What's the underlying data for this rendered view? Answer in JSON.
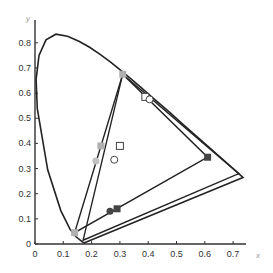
{
  "chart_data": {
    "type": "scatter",
    "title": "",
    "xlabel": "x",
    "ylabel": "y",
    "xlim": [
      0,
      0.78
    ],
    "ylim": [
      0,
      0.85
    ],
    "x_ticks": [
      "0",
      "0.1",
      "0.2",
      "0.3",
      "0.4",
      "0.5",
      "0.6",
      "0.7"
    ],
    "y_ticks": [
      "0",
      "0.1",
      "0.2",
      "0.3",
      "0.4",
      "0.5",
      "0.6",
      "0.7",
      "0.8"
    ],
    "grid": false,
    "spectral_locus": "CIE 1931 horseshoe",
    "triangles": [
      {
        "name": "gamut-1",
        "vertices": [
          [
            0.31,
            0.675
          ],
          [
            0.61,
            0.345
          ],
          [
            0.14,
            0.045
          ]
        ]
      },
      {
        "name": "gamut-2",
        "vertices": [
          [
            0.31,
            0.675
          ],
          [
            0.72,
            0.28
          ],
          [
            0.17,
            0.015
          ]
        ]
      }
    ],
    "series": [
      {
        "name": "gray-squares",
        "marker": "square",
        "color": "#b0b0b0",
        "points": [
          [
            0.31,
            0.675
          ],
          [
            0.233,
            0.39
          ],
          [
            0.14,
            0.045
          ]
        ]
      },
      {
        "name": "gray-circles",
        "marker": "circle",
        "color": "#c0c0c0",
        "points": [
          [
            0.215,
            0.33
          ]
        ]
      },
      {
        "name": "dark-square",
        "marker": "square",
        "color": "#444444",
        "points": [
          [
            0.29,
            0.14
          ],
          [
            0.61,
            0.345
          ]
        ]
      },
      {
        "name": "dark-circle",
        "marker": "circle",
        "color": "#444444",
        "points": [
          [
            0.265,
            0.13
          ]
        ]
      },
      {
        "name": "open-squares",
        "marker": "open-square",
        "color": "#444444",
        "points": [
          [
            0.39,
            0.585
          ],
          [
            0.3,
            0.39
          ]
        ]
      },
      {
        "name": "open-circles",
        "marker": "open-circle",
        "color": "#444444",
        "points": [
          [
            0.405,
            0.575
          ],
          [
            0.28,
            0.335
          ]
        ]
      }
    ]
  }
}
